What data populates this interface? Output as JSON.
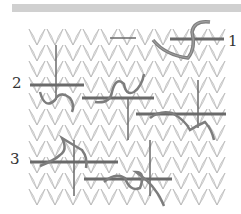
{
  "diagram": {
    "type": "knitting-technique-illustration",
    "header_bar_color": "#d0d0d0",
    "fabric_color": "#e6e6e6",
    "fabric_outline_color": "#b4b4b4",
    "needle_color": "#6a6a6a",
    "yarn_color": "#7d7d7d",
    "steps": [
      {
        "label": "1",
        "x": 228,
        "y": 34
      },
      {
        "label": "2",
        "x": 12,
        "y": 76
      },
      {
        "label": "3",
        "x": 10,
        "y": 152
      }
    ]
  }
}
